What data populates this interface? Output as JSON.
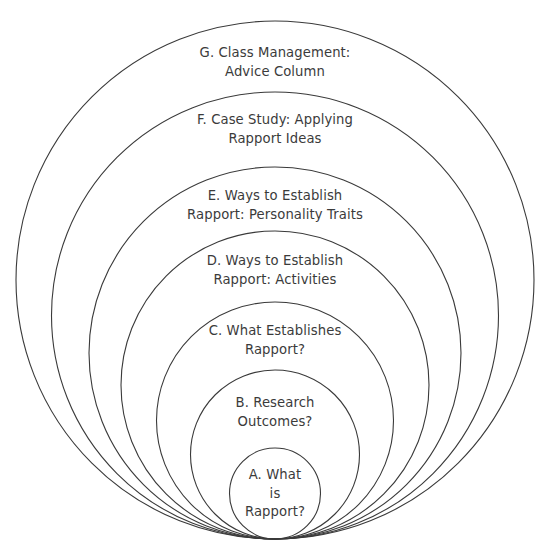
{
  "diagram": {
    "type": "nested-tangent-circles",
    "title": "",
    "background_color": "#ffffff",
    "stroke_color": "#3a3a3a",
    "text_color": "#3b3b3b",
    "stroke_width": 1.1,
    "canvas": {
      "width": 545,
      "height": 558
    },
    "tangent_point": {
      "x": 275,
      "y": 539
    },
    "rings": [
      {
        "id": "G",
        "label": "G. Class Management:\nAdvice Column",
        "center": {
          "x": 275,
          "y": 280
        },
        "radius": 259,
        "top": 21,
        "label_pos": {
          "x": 275,
          "y": 44
        }
      },
      {
        "id": "F",
        "label": "F. Case Study: Applying\nRapport Ideas",
        "center": {
          "x": 275,
          "y": 315.5
        },
        "radius": 223.5,
        "top": 92,
        "label_pos": {
          "x": 275,
          "y": 111
        }
      },
      {
        "id": "E",
        "label": "E. Ways to Establish\nRapport: Personality Traits",
        "center": {
          "x": 275,
          "y": 353
        },
        "radius": 186,
        "top": 167,
        "label_pos": {
          "x": 275,
          "y": 187
        }
      },
      {
        "id": "D",
        "label": "D. Ways to Establish\nRapport: Activities",
        "center": {
          "x": 275,
          "y": 385
        },
        "radius": 154,
        "top": 231,
        "label_pos": {
          "x": 275,
          "y": 252
        }
      },
      {
        "id": "C",
        "label": "C. What Establishes\nRapport?",
        "center": {
          "x": 275,
          "y": 420.5
        },
        "radius": 118.5,
        "top": 302,
        "label_pos": {
          "x": 275,
          "y": 322
        }
      },
      {
        "id": "B",
        "label": "B. Research\nOutcomes?",
        "center": {
          "x": 275,
          "y": 454.5
        },
        "radius": 84.5,
        "top": 370,
        "label_pos": {
          "x": 275,
          "y": 394
        }
      },
      {
        "id": "A",
        "label": "A. What\nis\nRapport?",
        "center": {
          "x": 275,
          "y": 493.5
        },
        "radius": 45.5,
        "top": 448,
        "label_pos": {
          "x": 275,
          "y": 466
        }
      }
    ]
  }
}
